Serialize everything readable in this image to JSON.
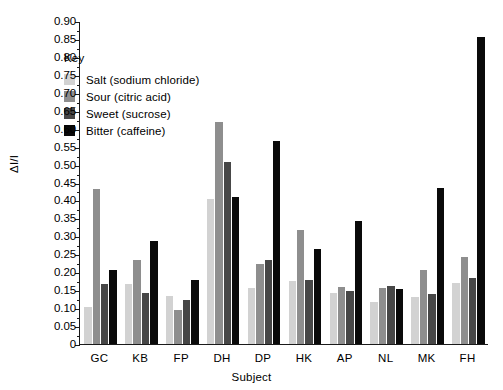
{
  "chart_data": {
    "type": "bar",
    "title": "",
    "xlabel": "Subject",
    "ylabel": "ΔI/I",
    "ylim": [
      0,
      0.9
    ],
    "ytick_step": 0.05,
    "grid": false,
    "legend_position": "upper-left-inside",
    "legend_title": "Key",
    "categories": [
      "GC",
      "KB",
      "FP",
      "DH",
      "DP",
      "HK",
      "AP",
      "NL",
      "MK",
      "FH"
    ],
    "ytick_labels": [
      "0",
      "0.05",
      "0.10",
      "0.15",
      "0.20",
      "0.25",
      "0.30",
      "0.35",
      "0.40",
      "0.45",
      "0.50",
      "0.55",
      "0.60",
      "0.65",
      "0.70",
      "0.75",
      "0.80",
      "0.85",
      "0.90"
    ],
    "series": [
      {
        "name": "Salt (sodium chloride)",
        "color": "#d2d2d2",
        "values": [
          0.103,
          0.167,
          0.134,
          0.403,
          0.156,
          0.175,
          0.142,
          0.116,
          0.132,
          0.17
        ]
      },
      {
        "name": "Sour (citric acid)",
        "color": "#8e8e8e",
        "values": [
          0.433,
          0.235,
          0.094,
          0.619,
          0.223,
          0.317,
          0.16,
          0.155,
          0.206,
          0.243
        ]
      },
      {
        "name": "Sweet (sucrose)",
        "color": "#474747",
        "values": [
          0.167,
          0.141,
          0.124,
          0.507,
          0.234,
          0.177,
          0.148,
          0.161,
          0.139,
          0.184
        ]
      },
      {
        "name": "Bitter (caffeine)",
        "color": "#0a0a0a",
        "values": [
          0.205,
          0.286,
          0.178,
          0.41,
          0.565,
          0.265,
          0.344,
          0.153,
          0.436,
          0.855
        ]
      }
    ]
  }
}
